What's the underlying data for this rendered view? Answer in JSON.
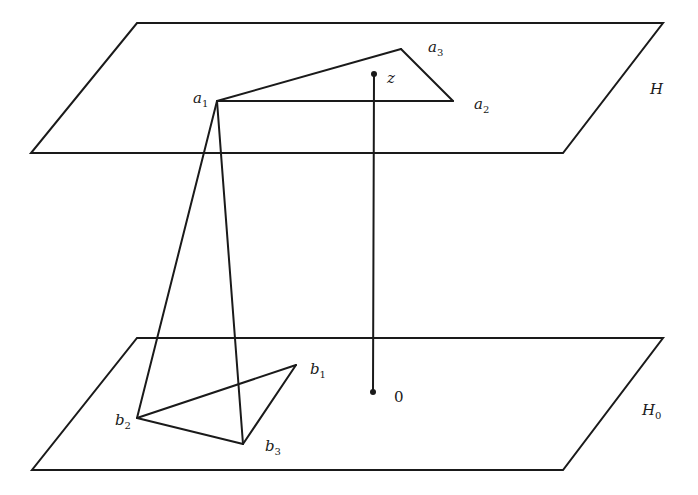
{
  "diagram": {
    "stroke_color": "#1a1a1a",
    "background": "#ffffff",
    "planes": [
      {
        "name": "H",
        "label": "H",
        "label_sub": "",
        "corners": [
          [
            137,
            23
          ],
          [
            663,
            23
          ],
          [
            563,
            153
          ],
          [
            31,
            153
          ]
        ],
        "label_pos": [
          650,
          94
        ]
      },
      {
        "name": "H0",
        "label": "H",
        "label_sub": "0",
        "corners": [
          [
            137,
            338
          ],
          [
            663,
            338
          ],
          [
            563,
            470
          ],
          [
            32,
            470
          ]
        ],
        "label_pos": [
          642,
          415
        ]
      }
    ],
    "points": {
      "a1": {
        "label": "a",
        "sub": "1",
        "pos": [
          217,
          101
        ],
        "label_pos": [
          193,
          103
        ]
      },
      "a2": {
        "label": "a",
        "sub": "2",
        "pos": [
          453,
          101
        ],
        "label_pos": [
          474,
          109
        ]
      },
      "a3": {
        "label": "a",
        "sub": "3",
        "pos": [
          401,
          49
        ],
        "label_pos": [
          428,
          52
        ]
      },
      "b1": {
        "label": "b",
        "sub": "1",
        "pos": [
          296,
          365
        ],
        "label_pos": [
          310,
          374
        ]
      },
      "b2": {
        "label": "b",
        "sub": "2",
        "pos": [
          137,
          418
        ],
        "label_pos": [
          115,
          425
        ]
      },
      "b3": {
        "label": "b",
        "sub": "3",
        "pos": [
          243,
          444
        ],
        "label_pos": [
          265,
          451
        ]
      },
      "z": {
        "label": "z",
        "sub": "",
        "pos": [
          374,
          74
        ],
        "label_pos": [
          387,
          83
        ]
      },
      "o": {
        "label": "0",
        "sub": "",
        "pos": [
          373,
          392
        ],
        "label_pos": [
          394,
          402
        ]
      }
    },
    "edges": [
      [
        "a1",
        "a2"
      ],
      [
        "a2",
        "a3"
      ],
      [
        "a3",
        "a1"
      ],
      [
        "b1",
        "b2"
      ],
      [
        "b2",
        "b3"
      ],
      [
        "b3",
        "b1"
      ],
      [
        "a1",
        "b2"
      ],
      [
        "a1",
        "b3"
      ],
      [
        "z",
        "o"
      ]
    ]
  }
}
